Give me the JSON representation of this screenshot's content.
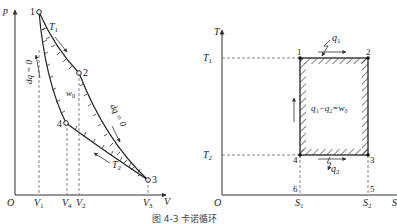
{
  "left_diagram": {
    "title": "p-V diagram",
    "y_axis": "p",
    "x_axis": "V",
    "origin": "O",
    "points": [
      {
        "id": "1",
        "label": "1"
      },
      {
        "id": "2",
        "label": "2"
      },
      {
        "id": "3",
        "label": "3"
      },
      {
        "id": "4",
        "label": "4"
      }
    ],
    "x_ticks": [
      "V1",
      "V4",
      "V2",
      "V3"
    ],
    "x_tick_main": [
      "V",
      "V",
      "V",
      "V"
    ],
    "x_tick_sub": [
      "1",
      "4",
      "2",
      "3"
    ],
    "annotations": {
      "T1_main": "T",
      "T1_sub": "1",
      "T2_main": "T",
      "T2_sub": "2",
      "w0_main": "w",
      "w0_sub": "0",
      "adiabatic_left": "dq = 0",
      "adiabatic_right": "dq = 0"
    }
  },
  "right_diagram": {
    "title": "T-S diagram",
    "y_axis": "T",
    "x_axis": "S",
    "origin": "O",
    "y_ticks": {
      "T1_main": "T",
      "T1_sub": "1",
      "T2_main": "T",
      "T2_sub": "2"
    },
    "x_ticks": {
      "S1_main": "S",
      "S1_sub": "1",
      "S2_main": "S",
      "S2_sub": "2"
    },
    "points": [
      "1",
      "2",
      "3",
      "4",
      "5",
      "6"
    ],
    "q1_main": "q",
    "q1_sub": "1",
    "q2_main": "q",
    "q2_sub": "2",
    "work_eq": "q₁−q₂=w₀"
  },
  "caption": "图 4-3  卡诺循环"
}
